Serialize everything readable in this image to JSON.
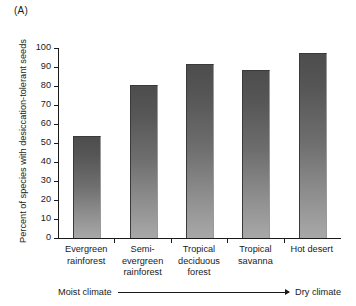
{
  "panel": {
    "label": "(A)"
  },
  "chart_data": {
    "type": "bar",
    "title": "",
    "subtitle": "",
    "xlabel": "",
    "ylabel": "Percent of species with desiccation-tolerant seeds",
    "ylim": [
      0,
      100
    ],
    "yticks": [
      0,
      10,
      20,
      30,
      40,
      50,
      60,
      70,
      80,
      90,
      100
    ],
    "ytick_labels": [
      "0",
      "10",
      "20",
      "30",
      "40",
      "50",
      "60",
      "70",
      "80",
      "90",
      "100"
    ],
    "grid": false,
    "legend": null,
    "categories": [
      "Evergreen rainforest",
      "Semi-evergreen rainforest",
      "Tropical deciduous forest",
      "Tropical savanna",
      "Hot desert"
    ],
    "category_lines": [
      [
        "Evergreen",
        "rainforest"
      ],
      [
        "Semi-",
        "evergreen",
        "rainforest"
      ],
      [
        "Tropical",
        "deciduous",
        "forest"
      ],
      [
        "Tropical",
        "savanna"
      ],
      [
        "Hot desert"
      ]
    ],
    "values": [
      53,
      80,
      91,
      88,
      97
    ],
    "bar_color_top": "#4d4d4d",
    "bar_color_bottom": "#a8a8a8",
    "annotations": [
      {
        "type": "arrow",
        "left_label": "Moist climate",
        "right_label": "Dry climate",
        "direction": "left-to-right"
      }
    ]
  },
  "axis_annotation": {
    "left_label": "Moist climate",
    "right_label": "Dry climate"
  }
}
